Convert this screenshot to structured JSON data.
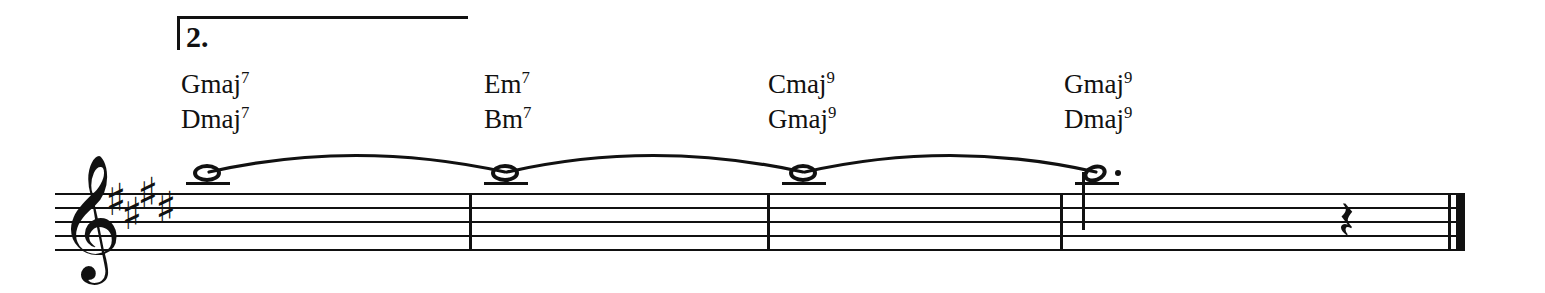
{
  "score": {
    "ending": {
      "label": "2.",
      "bracket_name": "second-ending-bracket"
    },
    "clef": "treble-clef",
    "clef_glyph": "𝄞",
    "key_signature": {
      "name": "four-sharps",
      "accidental_glyph": "♯",
      "count": 4
    },
    "chords": {
      "top_row": [
        {
          "root": "Gmaj",
          "extension": "7"
        },
        {
          "root": "Em",
          "extension": "7"
        },
        {
          "root": "Cmaj",
          "extension": "9"
        },
        {
          "root": "Gmaj",
          "extension": "9"
        }
      ],
      "bottom_row": [
        {
          "root": "Dmaj",
          "extension": "7"
        },
        {
          "root": "Bm",
          "extension": "7"
        },
        {
          "root": "Gmaj",
          "extension": "9"
        },
        {
          "root": "Dmaj",
          "extension": "9"
        }
      ]
    },
    "notes": [
      {
        "name": "note-1",
        "pitch": "A5",
        "duration": "whole",
        "dotted": false,
        "tied_to_next": true
      },
      {
        "name": "note-2",
        "pitch": "A5",
        "duration": "whole",
        "dotted": false,
        "tied_to_next": true
      },
      {
        "name": "note-3",
        "pitch": "A5",
        "duration": "whole",
        "dotted": false,
        "tied_to_next": true
      },
      {
        "name": "note-4",
        "pitch": "A5",
        "duration": "half",
        "dotted": true,
        "tied_to_next": false
      }
    ],
    "rests": [
      {
        "name": "rest-1",
        "duration": "quarter",
        "glyph": "𝄽"
      }
    ],
    "barlines": [
      {
        "name": "barline-1",
        "type": "single"
      },
      {
        "name": "barline-2",
        "type": "single"
      },
      {
        "name": "barline-3",
        "type": "single"
      },
      {
        "name": "barline-final",
        "type": "final-double"
      }
    ],
    "colors": {
      "ink": "#111111",
      "paper": "#ffffff"
    }
  }
}
